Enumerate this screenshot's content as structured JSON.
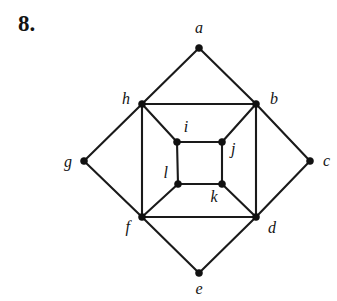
{
  "figure": {
    "problem_number": "8.",
    "width": 337,
    "height": 301,
    "background_color": "#ffffff",
    "ink_color": "#1a1a1a",
    "vertex_color": "#111111"
  },
  "graph": {
    "type": "undirected-graph",
    "vertex_count": 12,
    "edge_count": 20,
    "vertices": [
      {
        "id": "a",
        "label": "a",
        "x": 199,
        "y": 48,
        "label_x": 199,
        "label_y": 33,
        "label_anchor": "middle"
      },
      {
        "id": "b",
        "label": "b",
        "x": 256,
        "y": 104,
        "label_x": 270,
        "label_y": 104,
        "label_anchor": "start"
      },
      {
        "id": "c",
        "label": "c",
        "x": 310,
        "y": 161,
        "label_x": 323,
        "label_y": 166,
        "label_anchor": "start"
      },
      {
        "id": "d",
        "label": "d",
        "x": 256,
        "y": 217,
        "label_x": 268,
        "label_y": 233,
        "label_anchor": "start"
      },
      {
        "id": "e",
        "label": "e",
        "x": 199,
        "y": 273,
        "label_x": 199,
        "label_y": 294,
        "label_anchor": "middle"
      },
      {
        "id": "f",
        "label": "f",
        "x": 142,
        "y": 217,
        "label_x": 130,
        "label_y": 232,
        "label_anchor": "end"
      },
      {
        "id": "g",
        "label": "g",
        "x": 84,
        "y": 161,
        "label_x": 72,
        "label_y": 167,
        "label_anchor": "end"
      },
      {
        "id": "h",
        "label": "h",
        "x": 142,
        "y": 104,
        "label_x": 130,
        "label_y": 104,
        "label_anchor": "end"
      },
      {
        "id": "i",
        "label": "i",
        "x": 177,
        "y": 142,
        "label_x": 186,
        "label_y": 132,
        "label_anchor": "middle"
      },
      {
        "id": "j",
        "label": "j",
        "x": 222,
        "y": 142,
        "label_x": 231,
        "label_y": 154,
        "label_anchor": "start"
      },
      {
        "id": "k",
        "label": "k",
        "x": 222,
        "y": 184,
        "label_x": 214,
        "label_y": 202,
        "label_anchor": "middle"
      },
      {
        "id": "l",
        "label": "l",
        "x": 178,
        "y": 184,
        "label_x": 168,
        "label_y": 178,
        "label_anchor": "end"
      }
    ],
    "edges": [
      {
        "from": "a",
        "to": "h",
        "kind": "outer-diamond"
      },
      {
        "from": "a",
        "to": "b",
        "kind": "outer-diamond"
      },
      {
        "from": "b",
        "to": "c",
        "kind": "outer-diamond"
      },
      {
        "from": "c",
        "to": "d",
        "kind": "outer-diamond"
      },
      {
        "from": "d",
        "to": "e",
        "kind": "outer-diamond"
      },
      {
        "from": "e",
        "to": "f",
        "kind": "outer-diamond"
      },
      {
        "from": "f",
        "to": "g",
        "kind": "outer-diamond"
      },
      {
        "from": "g",
        "to": "h",
        "kind": "outer-diamond"
      },
      {
        "from": "h",
        "to": "b",
        "kind": "middle-square"
      },
      {
        "from": "b",
        "to": "d",
        "kind": "middle-square"
      },
      {
        "from": "d",
        "to": "f",
        "kind": "middle-square"
      },
      {
        "from": "f",
        "to": "h",
        "kind": "middle-square"
      },
      {
        "from": "i",
        "to": "j",
        "kind": "inner-square"
      },
      {
        "from": "j",
        "to": "k",
        "kind": "inner-square"
      },
      {
        "from": "k",
        "to": "l",
        "kind": "inner-square"
      },
      {
        "from": "l",
        "to": "i",
        "kind": "inner-square"
      },
      {
        "from": "h",
        "to": "i",
        "kind": "spoke"
      },
      {
        "from": "b",
        "to": "j",
        "kind": "spoke"
      },
      {
        "from": "d",
        "to": "k",
        "kind": "spoke"
      },
      {
        "from": "f",
        "to": "l",
        "kind": "spoke"
      }
    ]
  }
}
